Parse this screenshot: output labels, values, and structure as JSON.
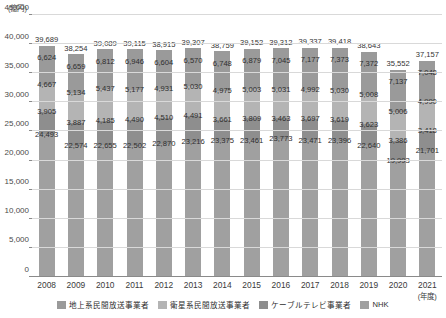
{
  "axes": {
    "y_unit": "(億円)",
    "x_unit": "(年度)",
    "yticks": [
      "0",
      "5,000",
      "10,000",
      "15,000",
      "20,000",
      "25,000",
      "30,000",
      "35,000",
      "40,000",
      "45,000"
    ]
  },
  "legend": {
    "items": [
      {
        "label": "地上系民間放送事業者",
        "color": "#9a9a9a"
      },
      {
        "label": "衛星系民間放送事業者",
        "color": "#b4b4b4"
      },
      {
        "label": "ケーブルテレビ事業者",
        "color": "#8e8e8e"
      },
      {
        "label": "NHK",
        "color": "#a0a0a0"
      }
    ]
  },
  "chart_data": {
    "type": "bar",
    "title": "",
    "xlabel": "(年度)",
    "ylabel": "(億円)",
    "ylim": [
      0,
      45000
    ],
    "ytick_step": 5000,
    "grid": true,
    "stacked": true,
    "legend_position": "bottom",
    "categories": [
      "2008",
      "2009",
      "2010",
      "2011",
      "2012",
      "2013",
      "2014",
      "2015",
      "2016",
      "2017",
      "2018",
      "2019",
      "2020",
      "2021"
    ],
    "series": [
      {
        "name": "NHK",
        "color": "#a0a0a0",
        "values": [
          24493,
          22574,
          22655,
          22502,
          22870,
          23216,
          23375,
          23461,
          23773,
          23471,
          23396,
          22640,
          19993,
          21701
        ]
      },
      {
        "name": "ケーブルテレビ事業者",
        "color": "#8e8e8e",
        "values": [
          3905,
          3887,
          4185,
          4490,
          4510,
          4491,
          3661,
          3809,
          3463,
          3697,
          3619,
          3623,
          3386,
          3418
        ]
      },
      {
        "name": "衛星系民間放送事業者",
        "color": "#b4b4b4",
        "values": [
          4667,
          5134,
          5437,
          5177,
          4931,
          5030,
          4975,
          5003,
          5031,
          4992,
          5030,
          5008,
          5006,
          4990
        ]
      },
      {
        "name": "地上系民間放送事業者",
        "color": "#9a9a9a",
        "values": [
          6624,
          6659,
          6812,
          6946,
          6604,
          6570,
          6748,
          6879,
          7045,
          7177,
          7373,
          7372,
          7137,
          7048
        ]
      }
    ],
    "totals": [
      39689,
      38254,
      39089,
      39115,
      38915,
      39307,
      38759,
      39152,
      39312,
      39337,
      39418,
      38643,
      35552,
      37157
    ]
  }
}
